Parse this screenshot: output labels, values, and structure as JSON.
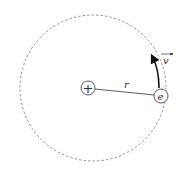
{
  "diagram": {
    "nucleus_symbol": "+",
    "electron_symbol": "e",
    "radius_label": "r",
    "velocity_label": "v",
    "colors": {
      "stroke": "#333333",
      "orbit": "#777777",
      "background": "#ffffff"
    }
  }
}
